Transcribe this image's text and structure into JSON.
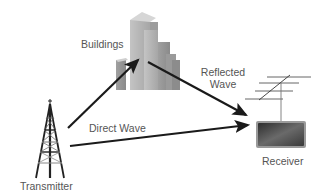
{
  "diagram": {
    "labels": {
      "buildings": "Buildings",
      "reflected_wave_line1": "Reflected",
      "reflected_wave_line2": "Wave",
      "direct_wave": "Direct Wave",
      "receiver": "Receiver",
      "transmitter": "Transmitter"
    },
    "nodes": [
      {
        "id": "transmitter",
        "label": "Transmitter",
        "icon": "radio-tower-icon"
      },
      {
        "id": "buildings",
        "label": "Buildings",
        "icon": "buildings-icon"
      },
      {
        "id": "receiver",
        "label": "Receiver",
        "icon": "tv-antenna-receiver-icon"
      }
    ],
    "edges": [
      {
        "from": "transmitter",
        "to": "buildings",
        "label": ""
      },
      {
        "from": "buildings",
        "to": "receiver",
        "label": "Reflected Wave"
      },
      {
        "from": "transmitter",
        "to": "receiver",
        "label": "Direct Wave"
      }
    ],
    "colors": {
      "arrow": "#1a1a1a",
      "label_text": "#555555",
      "building_light": "#b8b8b8",
      "building_dark": "#8e8e8e",
      "receiver_screen": "#4a4a4a",
      "tower": "#222222"
    }
  }
}
